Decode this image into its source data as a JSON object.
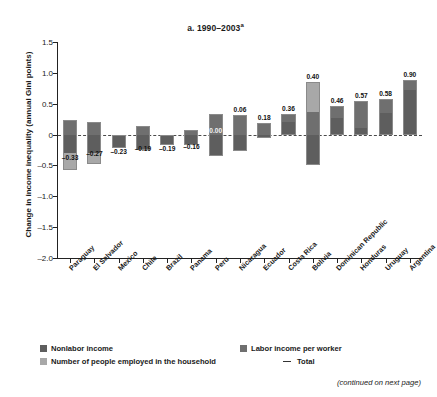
{
  "chart_data": {
    "type": "bar",
    "title": "a. 1990–2003",
    "title_superscript": "a",
    "xlabel": "",
    "ylabel": "Change in income inequality (annual Gini points)",
    "ylim": [
      -2.0,
      1.5
    ],
    "yticks": [
      1.5,
      1.0,
      0.5,
      0,
      -0.5,
      -1.0,
      -1.5,
      -2.0
    ],
    "ytick_labels": [
      "1.5",
      "1.0",
      "0.5",
      "0",
      "–0.5",
      "–1.0",
      "–1.5",
      "–2.0"
    ],
    "grid": false,
    "legend_position": "below",
    "stacked": true,
    "zero_line": true,
    "categories": [
      "Paraguay",
      "El Salvador",
      "Mexico",
      "Chile",
      "Brazil",
      "Panama",
      "Peru",
      "Nicaragua",
      "Ecuador",
      "Costa Rica",
      "Bolivia",
      "Dominican Republic",
      "Honduras",
      "Uruguay",
      "Argentina"
    ],
    "series": [
      {
        "name": "Nonlabor income",
        "color": "#5e5e5e",
        "values": [
          -0.3,
          -0.3,
          -0.22,
          -0.25,
          -0.17,
          -0.17,
          -0.35,
          -0.27,
          -0.05,
          0.2,
          -0.5,
          0.27,
          0.11,
          0.35,
          0.72
        ]
      },
      {
        "name": "Labor income per worker",
        "color": "#6f6f6f",
        "values": [
          0.24,
          0.21,
          0.0,
          0.14,
          0.0,
          0.07,
          0.33,
          0.31,
          0.19,
          0.14,
          0.36,
          0.19,
          0.44,
          0.22,
          0.17
        ]
      },
      {
        "name": "Number of people employed in the household",
        "color": "#a8a8a8",
        "values": [
          -0.27,
          -0.18,
          0.0,
          0.0,
          0.0,
          0.0,
          0.0,
          0.0,
          0.0,
          0.0,
          0.49,
          0.0,
          0.0,
          0.0,
          0.0
        ]
      }
    ],
    "totals": [
      -0.33,
      -0.27,
      -0.23,
      -0.19,
      -0.19,
      -0.16,
      0.0,
      0.06,
      0.18,
      0.36,
      0.4,
      0.46,
      0.57,
      0.58,
      0.9
    ],
    "total_labels": [
      "–0.33",
      "–0.27",
      "–0.23",
      "–0.19",
      "–0.19",
      "–0.16",
      "0.00",
      "0.06",
      "0.18",
      "0.36",
      "0.40",
      "0.46",
      "0.57",
      "0.58",
      "0.90"
    ],
    "legend": [
      {
        "label": "Nonlabor income",
        "marker": "swatch",
        "color": "#5e5e5e"
      },
      {
        "label": "Labor income per worker",
        "marker": "swatch",
        "color": "#6f6f6f"
      },
      {
        "label": "Number of people employed in the household",
        "marker": "swatch",
        "color": "#a8a8a8"
      },
      {
        "label": "Total",
        "marker": "dash",
        "color": "#333333"
      }
    ]
  },
  "footer": {
    "continued_note": "(continued on next page)"
  }
}
